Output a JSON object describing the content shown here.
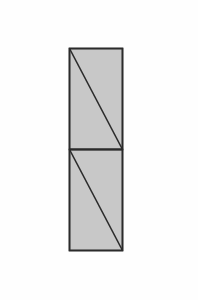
{
  "diagram": {
    "type": "geometric-figure",
    "colors": {
      "background": "#fefefe",
      "fill": "#c8c8c8",
      "stroke": "#2b2b2b"
    },
    "outer_rect": {
      "x": 69.5,
      "y": 48.5,
      "width": 53,
      "height": 202
    },
    "divider_y": 149.5,
    "panels": [
      {
        "id": "top",
        "x": 69.5,
        "y": 48.5,
        "width": 53,
        "height": 101,
        "diagonal": {
          "x1": 69.5,
          "y1": 48.5,
          "x2": 122.5,
          "y2": 149.5
        }
      },
      {
        "id": "bottom",
        "x": 69.5,
        "y": 149.5,
        "width": 53,
        "height": 101,
        "diagonal": {
          "x1": 69.5,
          "y1": 149.5,
          "x2": 122.5,
          "y2": 250.5
        }
      }
    ]
  }
}
